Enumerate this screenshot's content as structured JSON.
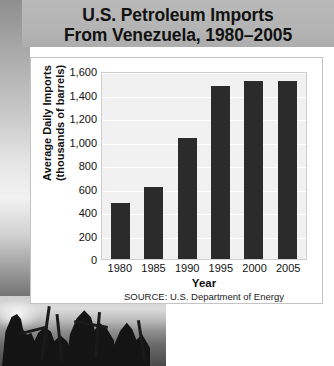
{
  "title": {
    "line1": "U.S. Petroleum Imports",
    "line2": "From Venezuela, 1980–2005"
  },
  "source_note": "SOURCE: U.S. Department of Energy",
  "photo": {
    "caption_alt": "oil-derricks-photo"
  },
  "colors": {
    "title_band": "#b3b3b3",
    "bar": "#2b2b2b",
    "plot_background": "#f1f1f1",
    "gridline": "#ffffff",
    "card_background": "#ffffff",
    "card_border": "#c4c4c4",
    "text": "#111111"
  },
  "chart_data": {
    "type": "bar",
    "title": "U.S. Petroleum Imports From Venezuela, 1980–2005",
    "xlabel": "Year",
    "ylabel": "Average Daily Imports (thousands of barrels)",
    "ylabel_line1": "Average Daily Imports",
    "ylabel_line2": "(thousands of barrels)",
    "categories": [
      "1980",
      "1985",
      "1990",
      "1995",
      "2000",
      "2005"
    ],
    "values": [
      480,
      610,
      1030,
      1470,
      1515,
      1515
    ],
    "ylim": [
      0,
      1600
    ],
    "ytick_step": 200,
    "ytick_labels": [
      "1,600",
      "1,400",
      "1,200",
      "1,000",
      "800",
      "600",
      "400",
      "200",
      "0"
    ],
    "ytick_values": [
      1600,
      1400,
      1200,
      1000,
      800,
      600,
      400,
      200,
      0
    ],
    "grid": true,
    "legend": false,
    "source": "SOURCE: U.S. Department of Energy"
  }
}
